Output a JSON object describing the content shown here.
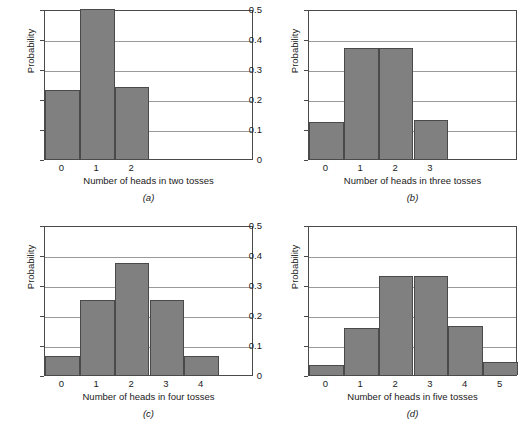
{
  "figure": {
    "axis_label_y": "Probability",
    "y_ticks": [
      "0.5",
      "0.4",
      "0.3",
      "0.2",
      "0.1",
      "0"
    ],
    "captions": {
      "a": "(a)",
      "b": "(b)",
      "c": "(c)",
      "d": "(d)"
    }
  },
  "chart_data": [
    {
      "type": "bar",
      "panel": "a",
      "title": "",
      "xlabel": "Number of heads in two tosses",
      "ylabel": "Probability",
      "categories": [
        "0",
        "1",
        "2"
      ],
      "values": [
        0.23,
        0.5,
        0.24
      ],
      "x_axis_slots": [
        "0",
        "1",
        "2",
        "3",
        "4",
        "5"
      ],
      "ylim": [
        0,
        0.5
      ],
      "yticks": [
        0,
        0.1,
        0.2,
        0.3,
        0.4,
        0.5
      ],
      "ytick_labels": [
        "0",
        "0.1",
        "0.2",
        "0.3",
        "0.4",
        "0.5"
      ],
      "grid": true,
      "legend": "none",
      "bar_color": "#808080",
      "bar_edge_color": "#4a4a4a"
    },
    {
      "type": "bar",
      "panel": "b",
      "title": "",
      "xlabel": "Number of heads in three tosses",
      "ylabel": "Probability",
      "categories": [
        "0",
        "1",
        "2",
        "3"
      ],
      "values": [
        0.125,
        0.37,
        0.37,
        0.13
      ],
      "x_axis_slots": [
        "0",
        "1",
        "2",
        "3",
        "4",
        "5"
      ],
      "ylim": [
        0,
        0.5
      ],
      "yticks": [
        0,
        0.1,
        0.2,
        0.3,
        0.4,
        0.5
      ],
      "ytick_labels": [
        "0",
        "0.1",
        "0.2",
        "0.3",
        "0.4",
        "0.5"
      ],
      "grid": true,
      "legend": "none",
      "bar_color": "#808080",
      "bar_edge_color": "#4a4a4a"
    },
    {
      "type": "bar",
      "panel": "c",
      "title": "",
      "xlabel": "Number of heads in four tosses",
      "ylabel": "Probability",
      "categories": [
        "0",
        "1",
        "2",
        "3",
        "4"
      ],
      "values": [
        0.0625,
        0.25,
        0.375,
        0.25,
        0.065
      ],
      "x_axis_slots": [
        "0",
        "1",
        "2",
        "3",
        "4",
        "5"
      ],
      "ylim": [
        0,
        0.5
      ],
      "yticks": [
        0,
        0.1,
        0.2,
        0.3,
        0.4,
        0.5
      ],
      "ytick_labels": [
        "0",
        "0.1",
        "0.2",
        "0.3",
        "0.4",
        "0.5"
      ],
      "grid": true,
      "legend": "none",
      "bar_color": "#808080",
      "bar_edge_color": "#4a4a4a"
    },
    {
      "type": "bar",
      "panel": "d",
      "title": "",
      "xlabel": "Number of heads in five tosses",
      "ylabel": "Probability",
      "categories": [
        "0",
        "1",
        "2",
        "3",
        "4",
        "5"
      ],
      "values": [
        0.035,
        0.158,
        0.33,
        0.33,
        0.165,
        0.043
      ],
      "x_axis_slots": [
        "0",
        "1",
        "2",
        "3",
        "4",
        "5"
      ],
      "ylim": [
        0,
        0.5
      ],
      "yticks": [
        0,
        0.1,
        0.2,
        0.3,
        0.4,
        0.5
      ],
      "ytick_labels": [
        "0",
        "0.1",
        "0.2",
        "0.3",
        "0.4",
        "0.5"
      ],
      "grid": true,
      "legend": "none",
      "bar_color": "#808080",
      "bar_edge_color": "#4a4a4a"
    }
  ]
}
